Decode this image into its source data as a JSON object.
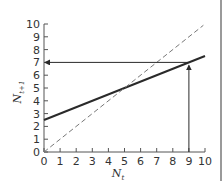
{
  "chart_data": {
    "type": "line",
    "title": "",
    "xlabel": "N_t",
    "ylabel": "N_{t+1}",
    "xlim": [
      0,
      10
    ],
    "ylim": [
      0,
      10
    ],
    "x_ticks": [
      0,
      1,
      2,
      3,
      4,
      5,
      6,
      7,
      8,
      9,
      10
    ],
    "y_ticks": [
      0,
      1,
      2,
      3,
      4,
      5,
      6,
      7,
      8,
      9,
      10
    ],
    "grid": false,
    "legend": null,
    "series": [
      {
        "name": "recruitment line",
        "style": "solid",
        "color": "#2a2a2a",
        "x": [
          0,
          10
        ],
        "y": [
          2.5,
          7.5
        ]
      },
      {
        "name": "replacement line (N_{t+1} = N_t)",
        "style": "dashed",
        "color": "#777777",
        "x": [
          0,
          9.9
        ],
        "y": [
          0,
          9.9
        ]
      }
    ],
    "annotations": [
      {
        "type": "arrow",
        "description": "vertical arrow from N_t = 9 up to the solid line",
        "from": [
          9,
          0
        ],
        "to": [
          9,
          7
        ]
      },
      {
        "type": "arrow",
        "description": "horizontal arrow from the solid line at N_t = 9 left to the y-axis at N_{t+1} = 7",
        "from": [
          9,
          7
        ],
        "to": [
          0,
          7
        ]
      }
    ],
    "intersection": [
      5,
      5
    ]
  },
  "labels": {
    "x_axis_main": "N",
    "x_axis_sub": "t",
    "y_axis_main": "N",
    "y_axis_sub": "t+1",
    "x_ticks": [
      "0",
      "1",
      "2",
      "3",
      "4",
      "5",
      "6",
      "7",
      "8",
      "9",
      "10"
    ],
    "y_ticks": [
      "0",
      "1",
      "2",
      "3",
      "4",
      "5",
      "6",
      "7",
      "8",
      "9",
      "10"
    ]
  }
}
